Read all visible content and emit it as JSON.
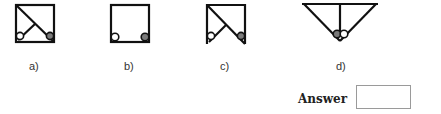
{
  "figures": [
    {
      "id": "a",
      "label": "a)",
      "shape": "square-diagonal-with-branch",
      "circles": [
        "white",
        "gray"
      ]
    },
    {
      "id": "b",
      "label": "b)",
      "shape": "square",
      "circles": [
        "white",
        "gray"
      ]
    },
    {
      "id": "c",
      "label": "c)",
      "shape": "open-bottom-square-diagonal-with-branch",
      "circles": [
        "white",
        "gray"
      ]
    },
    {
      "id": "d",
      "label": "d)",
      "shape": "inverted-triangle-with-vertical",
      "circles": [
        "gray",
        "white"
      ]
    }
  ],
  "answer": {
    "label": "Answer",
    "value": ""
  },
  "colors": {
    "line": "#111111",
    "circle_gray": "#7a7a7a",
    "circle_white": "#ffffff",
    "box_border": "#9a9a9a"
  }
}
